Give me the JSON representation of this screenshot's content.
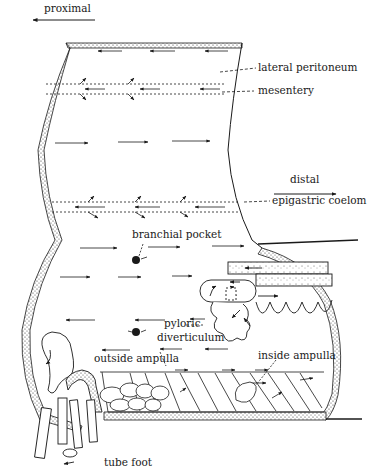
{
  "diagram": {
    "type": "anatomical-cross-section",
    "directions": {
      "proximal": "proximal",
      "distal": "distal"
    },
    "labels": {
      "lateral_peritoneum": "lateral peritoneum",
      "mesentery": "mesentery",
      "epigastric_coelom": "epigastric coelom",
      "branchial_pocket": "branchial pocket",
      "pyloric_diverticulum_1": "pyloric",
      "pyloric_diverticulum_2": "diverticulum",
      "outside_ampulla": "outside ampulla",
      "inside_ampulla": "inside ampulla",
      "tube_foot": "tube foot"
    },
    "colors": {
      "ink": "#1a1a1a",
      "background": "#ffffff",
      "stipple": "#444444"
    }
  }
}
